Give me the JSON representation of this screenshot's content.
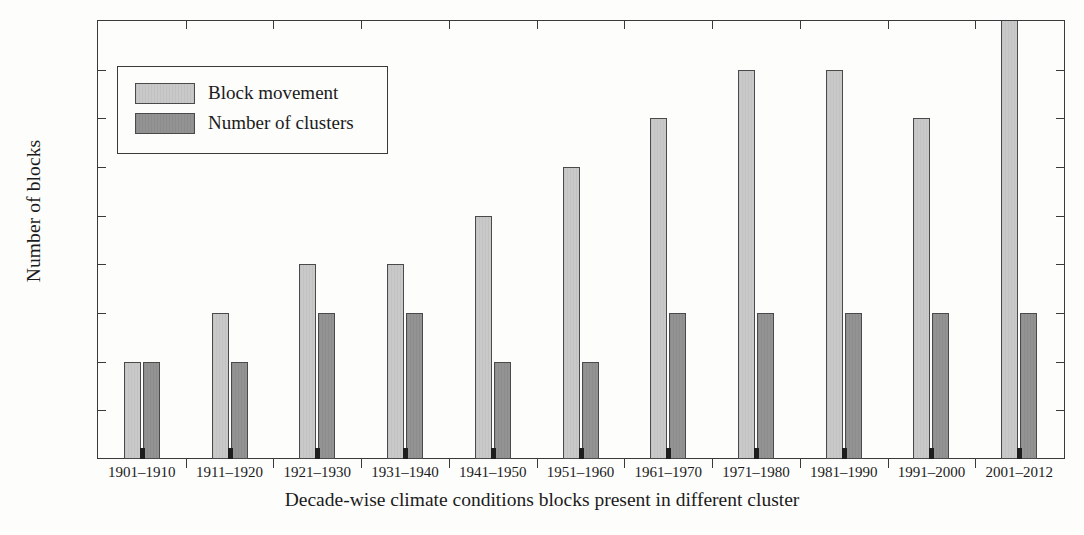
{
  "chart_data": {
    "type": "bar",
    "title": "",
    "xlabel": "Decade-wise climate conditions blocks present in different cluster",
    "ylabel": "Number of blocks",
    "categories": [
      "1901–1910",
      "1911–1920",
      "1921–1930",
      "1931–1940",
      "1941–1950",
      "1951–1960",
      "1961–1970",
      "1971–1980",
      "1981–1990",
      "1991–2000",
      "2001–2012"
    ],
    "series": [
      {
        "name": "Block movement",
        "color": "#c9c9c9",
        "values": [
          2,
          3,
          4,
          4,
          5,
          6,
          7,
          8,
          8,
          7,
          9.3
        ]
      },
      {
        "name": "Number of clusters",
        "color": "#939393",
        "values": [
          2,
          2,
          3,
          3,
          2,
          2,
          3,
          3,
          3,
          3,
          3
        ]
      }
    ],
    "ylim": [
      0,
      9
    ],
    "yticks": [
      "0",
      "1",
      "2",
      "3",
      "4",
      "5",
      "6",
      "7",
      "8",
      "9"
    ],
    "grid": false,
    "legend_position": "top-left-inside",
    "note_last_bar_clipped": "2001–2012 block movement bar extends past the top axis at 9"
  }
}
